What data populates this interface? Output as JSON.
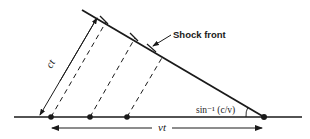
{
  "diagram": {
    "labels": {
      "shock_front": "Shock front",
      "ct": "ct",
      "vt": "vt",
      "angle": "sin⁻¹ (c/v)"
    },
    "colors": {
      "ink": "#1a1a1a",
      "background": "#ffffff"
    },
    "baseline": {
      "y": 117,
      "x_start": 14,
      "x_end": 302
    },
    "points": [
      {
        "name": "emission-point-1",
        "x": 51,
        "y": 117
      },
      {
        "name": "emission-point-2",
        "x": 90,
        "y": 117
      },
      {
        "name": "emission-point-3",
        "x": 127,
        "y": 117
      },
      {
        "name": "source-current-position",
        "x": 264,
        "y": 117
      }
    ],
    "shock_front_line": {
      "x1": 82,
      "y1": 10,
      "x2": 264,
      "y2": 117
    },
    "ct_arrow": {
      "x1": 97,
      "y1": 18,
      "x2": 40,
      "y2": 115
    },
    "dashed_rays": [
      {
        "x1": 51,
        "y1": 117,
        "x2": 106,
        "y2": 22
      },
      {
        "x1": 90,
        "y1": 117,
        "x2": 135,
        "y2": 38
      },
      {
        "x1": 127,
        "y1": 117,
        "x2": 163,
        "y2": 56
      }
    ],
    "vt_arrow": {
      "y": 128,
      "x_start": 51,
      "x_end": 264,
      "label_x": 160
    }
  }
}
